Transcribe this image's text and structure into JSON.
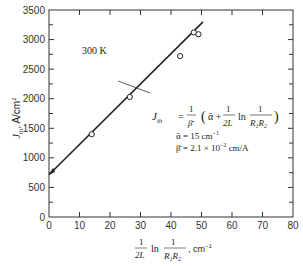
{
  "chart_data": {
    "type": "scatter",
    "title": "",
    "annotation_temp": "300 K",
    "xlabel": "(1/2L) ln (1/(R1R2)), cm^-1",
    "ylabel": "J_th, A/cm^2",
    "xlim": [
      0,
      80
    ],
    "ylim": [
      0,
      3500
    ],
    "x_ticks": [
      0,
      10,
      20,
      30,
      40,
      50,
      60,
      70,
      80
    ],
    "y_ticks": [
      0,
      500,
      1000,
      1500,
      2000,
      2500,
      3000,
      3500
    ],
    "grid": false,
    "series": [
      {
        "name": "measured",
        "marker": "open-circle",
        "points": [
          {
            "x": 14,
            "y": 1400
          },
          {
            "x": 26.5,
            "y": 2030
          },
          {
            "x": 43,
            "y": 2720
          },
          {
            "x": 47.5,
            "y": 3120
          },
          {
            "x": 49,
            "y": 3090
          }
        ]
      },
      {
        "name": "fit",
        "type": "line",
        "points": [
          {
            "x": 0,
            "y": 715
          },
          {
            "x": 50.5,
            "y": 3300
          }
        ]
      }
    ],
    "equation": {
      "lhs": "J_th",
      "rhs": "1/β̄ (ᾱ + (1/2L) ln (1/(R1R2)))",
      "alpha": "ᾱ = 15 cm⁻¹",
      "beta": "β̄ = 2.1 × 10⁻² cm/A"
    }
  },
  "labels": {
    "temp": "300 K",
    "ylabel_main": "J",
    "ylabel_sub": "th",
    "ylabel_units": ", A/cm",
    "ylabel_exp": "2",
    "xlabel_ln": "ln",
    "xlabel_units": ", cm",
    "xlabel_exp": "−1",
    "eq_J": "J",
    "eq_th": "th",
    "eq_equals": "=",
    "alpha_line": "ᾱ  = 15 cm",
    "alpha_exp": "−1",
    "beta_line": "β̄  = 2.1 × 10",
    "beta_exp": "−2",
    "beta_units": " cm/A"
  }
}
